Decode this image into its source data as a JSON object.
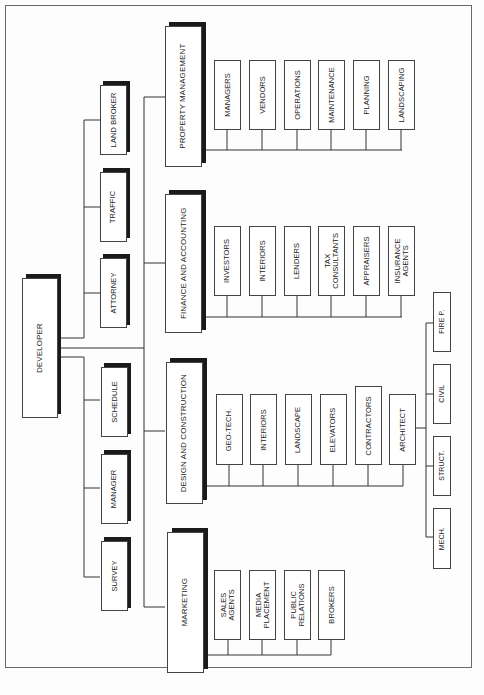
{
  "diagram": {
    "type": "organization chart",
    "root": {
      "label": "DEVELOPER"
    },
    "advisors": [
      {
        "label": "LAND BROKER"
      },
      {
        "label": "TRAFFIC"
      },
      {
        "label": "ATTORNEY"
      },
      {
        "label": "SCHEDULE"
      },
      {
        "label": "MANAGER"
      },
      {
        "label": "SURVEY"
      }
    ],
    "departments": [
      {
        "label": "PROPERTY MANAGEMENT",
        "children": [
          "MANAGERS",
          "VENDORS",
          "OPERATIONS",
          "MAINTENANCE",
          "PLANNING",
          "LANDSCAPING"
        ]
      },
      {
        "label": "FINANCE AND ACCOUNTING",
        "children": [
          "INVESTORS",
          "INTERIORS",
          "LENDERS",
          "TAX\nCONSULTANTS",
          "APPRAISERS",
          "INSURANCE\nAGENTS"
        ]
      },
      {
        "label": "DESIGN AND CONSTRUCTION",
        "children": [
          "GEO-TECH.",
          "INTERIORS",
          "LANDSCAPE",
          "ELEVATORS",
          "CONTRACTORS",
          "ARCHITECT"
        ],
        "architect_children": [
          "FIRE P.",
          "CIVIL",
          "STRUCT.",
          "MECH."
        ]
      },
      {
        "label": "MARKETING",
        "children": [
          "SALES\nAGENTS",
          "MEDIA\nPLACEMENT",
          "PUBLIC\nRELATIONS",
          "BROKERS"
        ]
      }
    ],
    "colors": {
      "line": "#333333",
      "shadow": "#1a1a1a",
      "border": "#444444",
      "background": "#fdfdfd"
    }
  }
}
